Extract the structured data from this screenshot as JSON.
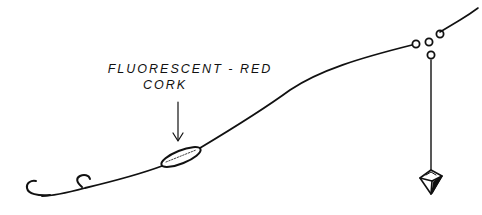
{
  "diagram": {
    "type": "fishing-rig-illustration",
    "labels": {
      "cork_line1": "FLUORESCENT - RED",
      "cork_line2": "CORK"
    },
    "components": [
      {
        "name": "main-line",
        "description": "line rising from swivel to upper right"
      },
      {
        "name": "three-way-swivel",
        "description": "three-ring swivel at upper right"
      },
      {
        "name": "sinker-dropper",
        "description": "vertical line from swivel to pyramid sinker"
      },
      {
        "name": "pyramid-sinker",
        "description": "pyramid sinker hanging below swivel"
      },
      {
        "name": "leader",
        "description": "long curved leader from swivel down-left"
      },
      {
        "name": "cork",
        "description": "elongated fluorescent-red cork on leader"
      },
      {
        "name": "hook-1",
        "description": "trailing hook at end of leader"
      },
      {
        "name": "hook-2",
        "description": "second hook on leader"
      }
    ],
    "colors": {
      "ink": "#111111",
      "background": "#ffffff"
    }
  }
}
